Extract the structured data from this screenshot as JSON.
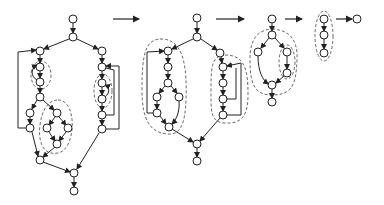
{
  "diagram": {
    "stages": [
      {
        "id": "stage-1",
        "node_count": 22,
        "loop_regions": 3
      },
      {
        "id": "stage-2",
        "node_count": 16,
        "loop_regions": 2
      },
      {
        "id": "stage-3",
        "node_count": 7,
        "loop_regions": 2
      },
      {
        "id": "stage-4",
        "node_count": 3,
        "loop_regions": 1
      },
      {
        "id": "stage-5",
        "node_count": 1,
        "loop_regions": 0
      }
    ],
    "transition_arrows": 4,
    "colors": {
      "stroke": "#222222",
      "dashed": "#444444",
      "background": "#ffffff"
    }
  }
}
